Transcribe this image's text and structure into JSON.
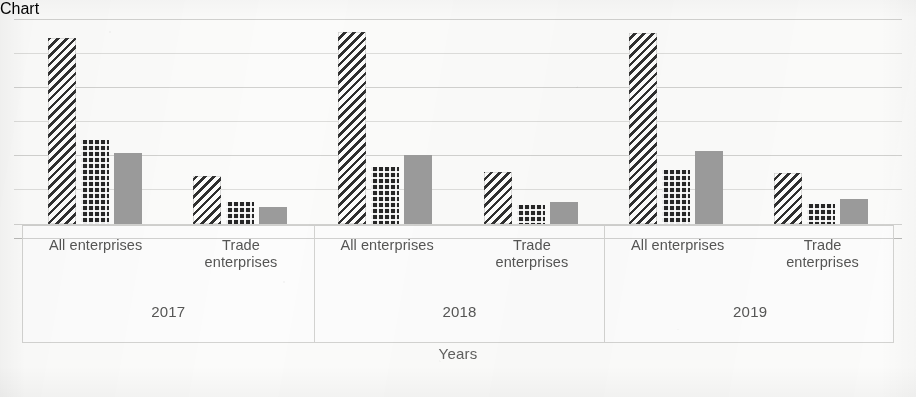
{
  "chart_data": {
    "type": "bar",
    "title": "",
    "subtitle": "",
    "xlabel": "Years",
    "ylabel": "",
    "grid": true,
    "legend_position": "none",
    "axis": {
      "baseline_value": 0,
      "ylim": [
        0,
        70
      ],
      "gridline_count": 7,
      "gridline_values": [
        0,
        10,
        20,
        30,
        40,
        50,
        60
      ],
      "tick_labels_visible": false
    },
    "group_levels": [
      "year",
      "enterprise_type"
    ],
    "years": [
      "2017",
      "2018",
      "2019"
    ],
    "enterprise_types": [
      "All enterprises",
      "Trade enterprises"
    ],
    "series": [
      {
        "name": "series-1",
        "pattern": "diagonal-hatch",
        "color": "#2f2f2f",
        "values": [
          55.0,
          14.2,
          57.0,
          15.3,
          56.5,
          15.0
        ]
      },
      {
        "name": "series-2",
        "pattern": "dark-dotted",
        "color": "#262626",
        "values": [
          24.7,
          6.5,
          16.8,
          5.6,
          16.0,
          5.9
        ]
      },
      {
        "name": "series-3",
        "pattern": "solid-gray",
        "color": "#9b9b9b",
        "values": [
          21.0,
          5.0,
          20.3,
          6.5,
          21.5,
          7.4
        ]
      }
    ],
    "categories": [
      "2017 / All enterprises",
      "2017 / Trade enterprises",
      "2018 / All enterprises",
      "2018 / Trade enterprises",
      "2019 / All enterprises",
      "2019 / Trade enterprises"
    ]
  },
  "chart": {
    "axis_title": "Years",
    "groups": [
      {
        "year": "2017",
        "categories": [
          {
            "label_line1": "All enterprises",
            "label_line2": "",
            "bars": [
              {
                "series": "series-1",
                "pattern": "hatch",
                "top": 38,
                "height": 186
              },
              {
                "series": "series-2",
                "pattern": "dots",
                "top": 140,
                "height": 84
              },
              {
                "series": "series-3",
                "pattern": "solid",
                "top": 153,
                "height": 71
              }
            ]
          },
          {
            "label_line1": "Trade",
            "label_line2": "enterprises",
            "bars": [
              {
                "series": "series-1",
                "pattern": "hatch",
                "top": 176,
                "height": 48
              },
              {
                "series": "series-2",
                "pattern": "dots",
                "top": 202,
                "height": 22
              },
              {
                "series": "series-3",
                "pattern": "solid",
                "top": 207,
                "height": 17
              }
            ]
          }
        ]
      },
      {
        "year": "2018",
        "categories": [
          {
            "label_line1": "All enterprises",
            "label_line2": "",
            "bars": [
              {
                "series": "series-1",
                "pattern": "hatch",
                "top": 32,
                "height": 192
              },
              {
                "series": "series-2",
                "pattern": "dots",
                "top": 167,
                "height": 57
              },
              {
                "series": "series-3",
                "pattern": "solid",
                "top": 155,
                "height": 69
              }
            ]
          },
          {
            "label_line1": "Trade",
            "label_line2": "enterprises",
            "bars": [
              {
                "series": "series-1",
                "pattern": "hatch",
                "top": 172,
                "height": 52
              },
              {
                "series": "series-2",
                "pattern": "dots",
                "top": 205,
                "height": 19
              },
              {
                "series": "series-3",
                "pattern": "solid",
                "top": 202,
                "height": 22
              }
            ]
          }
        ]
      },
      {
        "year": "2019",
        "categories": [
          {
            "label_line1": "All enterprises",
            "label_line2": "",
            "bars": [
              {
                "series": "series-1",
                "pattern": "hatch",
                "top": 33,
                "height": 191
              },
              {
                "series": "series-2",
                "pattern": "dots",
                "top": 170,
                "height": 54
              },
              {
                "series": "series-3",
                "pattern": "solid",
                "top": 151,
                "height": 73
              }
            ]
          },
          {
            "label_line1": "Trade",
            "label_line2": "enterprises",
            "bars": [
              {
                "series": "series-1",
                "pattern": "hatch",
                "top": 173,
                "height": 51
              },
              {
                "series": "series-2",
                "pattern": "dots",
                "top": 204,
                "height": 20
              },
              {
                "series": "series-3",
                "pattern": "solid",
                "top": 199,
                "height": 25
              }
            ]
          }
        ]
      }
    ],
    "gridlines": [
      19,
      53,
      87,
      121,
      155,
      189,
      224
    ]
  },
  "colors": {
    "background": "#fbfbfa",
    "gridline": "#c9c9c7",
    "hatch": "#2f2f2f",
    "dots": "#262626",
    "solid_gray": "#9b9b9b",
    "text": "#555554",
    "border": "#d3d3d1"
  }
}
